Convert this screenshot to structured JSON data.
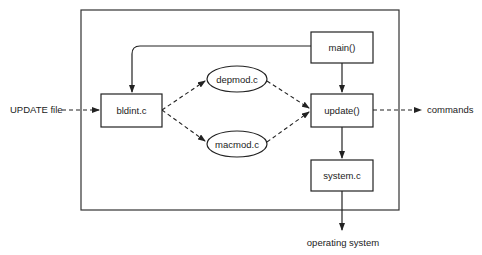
{
  "diagram": {
    "external_inputs": {
      "update_file": "UPDATE file"
    },
    "external_outputs": {
      "commands": "commands",
      "operating_system": "operating system"
    },
    "nodes": {
      "main": "main()",
      "bldint": "bldint.c",
      "depmod": "depmod.c",
      "macmod": "macmod.c",
      "update": "update()",
      "system": "system.c"
    },
    "edges": [
      {
        "from": "UPDATE file",
        "to": "bldint.c",
        "style": "dashed"
      },
      {
        "from": "main()",
        "to": "bldint.c",
        "style": "solid"
      },
      {
        "from": "main()",
        "to": "update()",
        "style": "solid"
      },
      {
        "from": "bldint.c",
        "to": "depmod.c",
        "style": "dashed"
      },
      {
        "from": "bldint.c",
        "to": "macmod.c",
        "style": "dashed"
      },
      {
        "from": "depmod.c",
        "to": "update()",
        "style": "dashed"
      },
      {
        "from": "macmod.c",
        "to": "update()",
        "style": "dashed"
      },
      {
        "from": "update()",
        "to": "commands",
        "style": "dashed"
      },
      {
        "from": "update()",
        "to": "system.c",
        "style": "solid"
      },
      {
        "from": "system.c",
        "to": "operating system",
        "style": "solid"
      }
    ]
  }
}
